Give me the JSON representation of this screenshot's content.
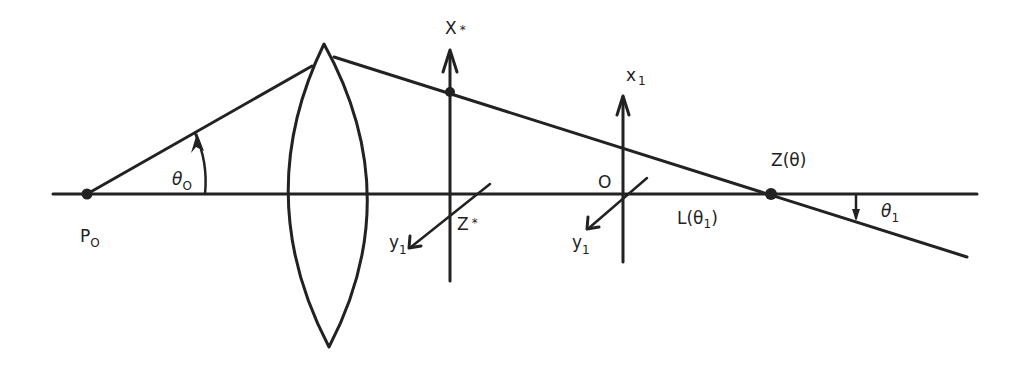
{
  "diagram": {
    "type": "optical-ray-diagram",
    "colors": {
      "ink": "#222222",
      "background": "#ffffff"
    },
    "labels": {
      "source_point": {
        "main": "P",
        "sub": "O"
      },
      "incident_angle": {
        "main": "θ",
        "sub": "O"
      },
      "intermediate_axis_x": {
        "main": "X",
        "sup": "*"
      },
      "intermediate_axis_z": {
        "main": "Z",
        "sup": "*"
      },
      "intermediate_axis_y": {
        "main": "y",
        "sub": "1"
      },
      "local_axis_x": {
        "main": "x",
        "sub": "1"
      },
      "local_origin": {
        "main": "O"
      },
      "local_axis_y": {
        "main": "y",
        "sub": "1"
      },
      "length": {
        "main": "L(θ",
        "sub": "1",
        "tail": ")"
      },
      "focus_point": {
        "main": "Z(θ)"
      },
      "exit_angle": {
        "main": "θ",
        "sub": "1"
      }
    },
    "elements": [
      "optical-axis",
      "source-point-P0",
      "incident-ray",
      "biconvex-lens",
      "refracted-ray",
      "X*-axis",
      "Z*-y1-axis",
      "x1-axis",
      "O-y1-axis",
      "focus-point-Z-theta"
    ]
  }
}
